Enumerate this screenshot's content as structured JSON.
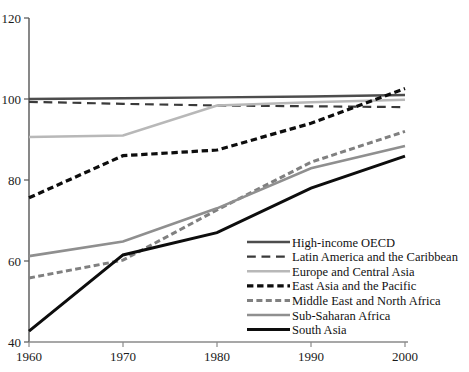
{
  "chart_data": {
    "type": "line",
    "title": "",
    "xlabel": "",
    "ylabel": "",
    "x": [
      1960,
      1970,
      1980,
      1990,
      2000
    ],
    "xlim": [
      1960,
      2000
    ],
    "ylim": [
      40,
      120
    ],
    "yticks": [
      40,
      60,
      80,
      100,
      120
    ],
    "xticks": [
      1960,
      1970,
      1980,
      1990,
      2000
    ],
    "grid": false,
    "legend_position": "inside-lower-right",
    "series": [
      {
        "name": "High-income OECD",
        "color": "#4d4d4d",
        "style": "solid",
        "width": 2.4,
        "values": [
          100.0,
          100.2,
          100.4,
          100.6,
          101.0
        ]
      },
      {
        "name": "Latin America and the Caribbean",
        "color": "#3a3a3a",
        "style": "long-dash",
        "width": 2.2,
        "values": [
          99.3,
          98.8,
          98.4,
          98.2,
          98.0
        ]
      },
      {
        "name": "Europe and Central Asia",
        "color": "#b8b8b8",
        "style": "solid",
        "width": 2.6,
        "values": [
          90.6,
          91.0,
          98.4,
          99.2,
          99.8
        ]
      },
      {
        "name": "East Asia and the Pacific",
        "color": "#0d0d0d",
        "style": "dash",
        "width": 3.2,
        "values": [
          75.6,
          86.0,
          87.4,
          94.0,
          102.6
        ]
      },
      {
        "name": "Middle East and North Africa",
        "color": "#808080",
        "style": "dash",
        "width": 3.0,
        "values": [
          55.8,
          60.2,
          72.6,
          84.4,
          92.0
        ]
      },
      {
        "name": "Sub-Saharan Africa",
        "color": "#8f8f8f",
        "style": "solid",
        "width": 2.6,
        "values": [
          61.2,
          64.8,
          73.0,
          82.9,
          88.4
        ]
      },
      {
        "name": "South Asia",
        "color": "#0d0d0d",
        "style": "solid",
        "width": 3.0,
        "values": [
          42.7,
          61.5,
          67.0,
          78.0,
          85.9
        ]
      }
    ]
  },
  "axis": {
    "ytick_labels": [
      "120",
      "100",
      "80",
      "60",
      "40"
    ],
    "xtick_labels": [
      "1960",
      "1970",
      "1980",
      "1990",
      "2000"
    ]
  },
  "legend": {
    "items": [
      {
        "label": "High-income OECD"
      },
      {
        "label": "Latin America and the Caribbean"
      },
      {
        "label": "Europe and Central Asia"
      },
      {
        "label": "East Asia and the Pacific"
      },
      {
        "label": "Middle East and North Africa"
      },
      {
        "label": "Sub-Saharan Africa"
      },
      {
        "label": "South Asia"
      }
    ]
  }
}
